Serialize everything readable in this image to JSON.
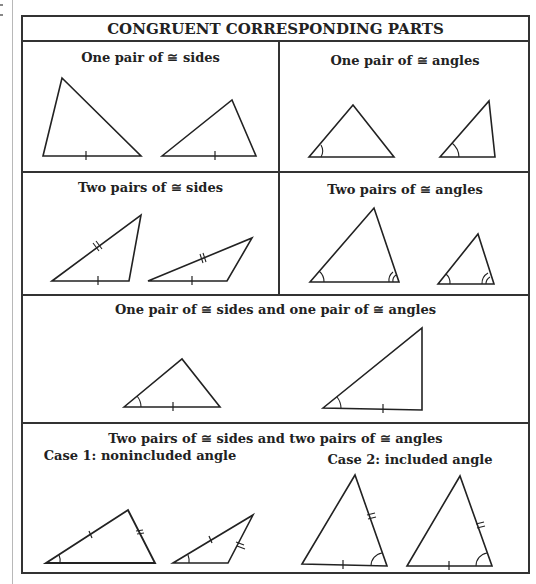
{
  "header": {
    "title": "CONGRUENT CORRESPONDING PARTS"
  },
  "panels": [
    {
      "id": "one-pair-sides",
      "title": "One pair of ≅ sides"
    },
    {
      "id": "one-pair-angles",
      "title": "One pair of ≅ angles"
    },
    {
      "id": "two-pairs-sides",
      "title": "Two pairs of ≅ sides"
    },
    {
      "id": "two-pairs-angles",
      "title": "Two pairs of ≅ angles"
    },
    {
      "id": "side-and-angle",
      "title": "One pair of ≅ sides and one pair of ≅ angles"
    },
    {
      "id": "two-sides-two-angles",
      "title": "Two pairs of ≅ sides and two pairs of ≅ angles",
      "cases": [
        {
          "label": "Case 1: nonincluded angle"
        },
        {
          "label": "Case 2: included angle"
        }
      ]
    }
  ],
  "colors": {
    "ink": "#222222",
    "rule": "#333333",
    "background": "#ffffff"
  }
}
